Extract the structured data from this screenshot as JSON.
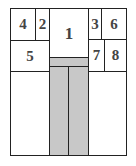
{
  "diagram": {
    "type": "floor-plan-layout",
    "fill_color": "#c8c8c8",
    "line_color": "#222222",
    "regions": [
      {
        "id": "outer",
        "label": "",
        "x": 10,
        "y": 8,
        "w": 117,
        "h": 148
      },
      {
        "id": "box-4",
        "label": "4",
        "x": 10,
        "y": 8,
        "w": 26,
        "h": 33
      },
      {
        "id": "box-2",
        "label": "2",
        "x": 35,
        "y": 8,
        "w": 15,
        "h": 33
      },
      {
        "id": "box-1",
        "label": "1",
        "x": 49,
        "y": 8,
        "w": 40,
        "h": 50
      },
      {
        "id": "box-3",
        "label": "3",
        "x": 88,
        "y": 8,
        "w": 14,
        "h": 32
      },
      {
        "id": "box-6",
        "label": "6",
        "x": 101,
        "y": 8,
        "w": 26,
        "h": 32
      },
      {
        "id": "box-5",
        "label": "5",
        "x": 10,
        "y": 40,
        "w": 40,
        "h": 32
      },
      {
        "id": "box-7",
        "label": "7",
        "x": 88,
        "y": 39,
        "w": 17,
        "h": 33
      },
      {
        "id": "box-8",
        "label": "8",
        "x": 104,
        "y": 39,
        "w": 23,
        "h": 33
      },
      {
        "id": "gray-band",
        "label": "",
        "x": 49,
        "y": 57,
        "w": 40,
        "h": 10
      },
      {
        "id": "gray-col-left",
        "label": "",
        "x": 49,
        "y": 66,
        "w": 20,
        "h": 90
      },
      {
        "id": "gray-col-right",
        "label": "",
        "x": 68,
        "y": 66,
        "w": 21,
        "h": 90
      }
    ],
    "labels": {
      "one": "1",
      "two": "2",
      "three": "3",
      "four": "4",
      "five": "5",
      "six": "6",
      "seven": "7",
      "eight": "8"
    }
  }
}
